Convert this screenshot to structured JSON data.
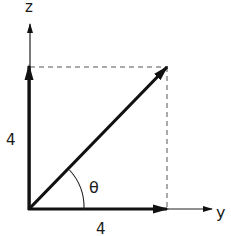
{
  "diagram": {
    "axes": {
      "z_label": "z",
      "y_label": "y"
    },
    "components": {
      "z_magnitude": "4",
      "y_magnitude": "4"
    },
    "angle_label": "θ",
    "colors": {
      "stroke": "#111111",
      "dashed": "#555555",
      "background": "#ffffff"
    }
  }
}
